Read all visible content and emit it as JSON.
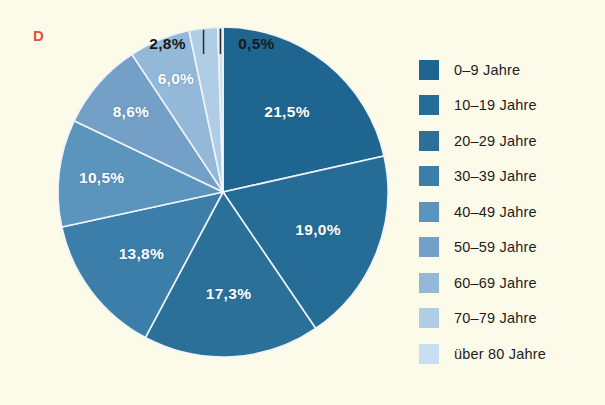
{
  "panel": {
    "letter": "D"
  },
  "colors": {
    "background": "#fcfbe9",
    "panel_letter": "#e2552a",
    "label_inside": "#ffffff",
    "label_outside": "#191919",
    "slice_divider": "#eef4f8",
    "leader_line": "#2a2a2a"
  },
  "chart_data": {
    "type": "pie",
    "title": "",
    "subtitle": "",
    "xlabel": "",
    "ylabel": "",
    "legend_position": "right",
    "grid": false,
    "start_angle_deg": 0,
    "direction": "clockwise",
    "units": "percent",
    "total": 100.0,
    "categories": [
      "0–9 Jahre",
      "10–19 Jahre",
      "20–29 Jahre",
      "30–39 Jahre",
      "40–49 Jahre",
      "50–59 Jahre",
      "60–69 Jahre",
      "70–79 Jahre",
      "über 80 Jahre"
    ],
    "values": [
      21.5,
      19.0,
      17.3,
      13.8,
      10.5,
      8.6,
      6.0,
      2.8,
      0.5
    ],
    "value_labels": [
      "21,5%",
      "19,0%",
      "17,3%",
      "13,8%",
      "10,5%",
      "8,6%",
      "6,0%",
      "2,8%",
      "0,5%"
    ],
    "slice_colors": [
      "#1e6690",
      "#256d96",
      "#2a7099",
      "#3c7eaa",
      "#5b94bc",
      "#749fc6",
      "#93b8d8",
      "#b0cde6",
      "#c8dff1"
    ],
    "label_placement": [
      "inside",
      "inside",
      "inside",
      "inside",
      "inside",
      "inside",
      "inside",
      "outside",
      "outside"
    ]
  },
  "legend": {
    "items": [
      {
        "label": "0–9 Jahre",
        "color": "#1e6690"
      },
      {
        "label": "10–19 Jahre",
        "color": "#256d96"
      },
      {
        "label": "20–29 Jahre",
        "color": "#2a7099"
      },
      {
        "label": "30–39 Jahre",
        "color": "#3c7eaa"
      },
      {
        "label": "40–49 Jahre",
        "color": "#5b94bc"
      },
      {
        "label": "50–59 Jahre",
        "color": "#749fc6"
      },
      {
        "label": "60–69 Jahre",
        "color": "#93b8d8"
      },
      {
        "label": "70–79 Jahre",
        "color": "#b0cde6"
      },
      {
        "label": "über 80 Jahre",
        "color": "#c8dff1"
      }
    ]
  }
}
